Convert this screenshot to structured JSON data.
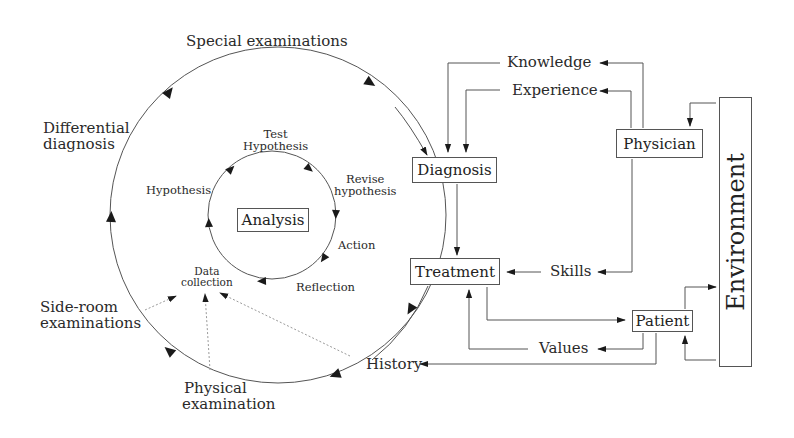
{
  "diagram": {
    "outer_cycle": {
      "special_examinations": "Special examinations",
      "differential_diagnosis": [
        "Differential",
        "diagnosis"
      ],
      "side_room_examinations": [
        "Side-room",
        "examinations"
      ],
      "physical_examination": [
        "Physical",
        "examination"
      ],
      "history": "History"
    },
    "inner_cycle": {
      "center": "Analysis",
      "test_hypothesis": [
        "Test",
        "Hypothesis"
      ],
      "revise_hypothesis": [
        "Revise",
        "hypothesis"
      ],
      "action": "Action",
      "reflection": "Reflection",
      "data_collection": [
        "Data",
        "collection"
      ],
      "hypothesis": "Hypothesis"
    },
    "nodes": {
      "diagnosis": "Diagnosis",
      "treatment": "Treatment",
      "physician": "Physician",
      "patient": "Patient",
      "environment": "Environment"
    },
    "flows": {
      "knowledge": "Knowledge",
      "experience": "Experience",
      "skills": "Skills",
      "values": "Values"
    },
    "colors": {
      "line": "#555555",
      "dotted": "#9a9a9a",
      "arrow": "#1a1a1a",
      "text": "#222222"
    }
  }
}
